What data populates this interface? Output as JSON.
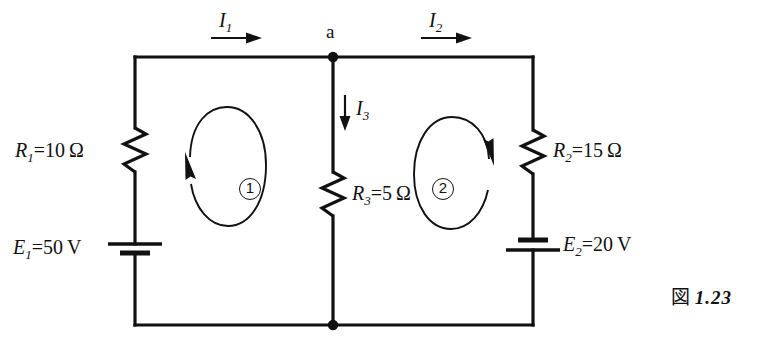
{
  "figure": {
    "caption_kanji": "図",
    "caption_number": "1.23",
    "caption_full": "図 1.23"
  },
  "node": {
    "label_a": "a"
  },
  "currents": [
    {
      "name": "current-i1",
      "symbol": "I",
      "subscript": "1",
      "direction": "right"
    },
    {
      "name": "current-i2",
      "symbol": "I",
      "subscript": "2",
      "direction": "right"
    },
    {
      "name": "current-i3",
      "symbol": "I",
      "subscript": "3",
      "direction": "down"
    }
  ],
  "resistors": [
    {
      "name": "resistor-r1",
      "symbol": "R",
      "subscript": "1",
      "equals": "=",
      "value": "10",
      "unit": "Ω",
      "full": "R1=10 Ω"
    },
    {
      "name": "resistor-r2",
      "symbol": "R",
      "subscript": "2",
      "equals": "=",
      "value": "15",
      "unit": "Ω",
      "full": "R2=15 Ω"
    },
    {
      "name": "resistor-r3",
      "symbol": "R",
      "subscript": "3",
      "equals": "=",
      "value": "5",
      "unit": "Ω",
      "full": "R3=5 Ω"
    }
  ],
  "sources": [
    {
      "name": "source-e1",
      "symbol": "E",
      "subscript": "1",
      "equals": "=",
      "value": "50",
      "unit": "V",
      "full": "E1=50 V"
    },
    {
      "name": "source-e2",
      "symbol": "E",
      "subscript": "2",
      "equals": "=",
      "value": "20",
      "unit": "V",
      "full": "E2=20 V"
    }
  ],
  "loops": [
    {
      "name": "loop-1",
      "label": "①",
      "number": "1",
      "direction": "clockwise"
    },
    {
      "name": "loop-2",
      "label": "②",
      "number": "2",
      "direction": "clockwise"
    }
  ],
  "colors": {
    "wire": "#111111",
    "background": "#ffffff",
    "text": "#111111"
  }
}
